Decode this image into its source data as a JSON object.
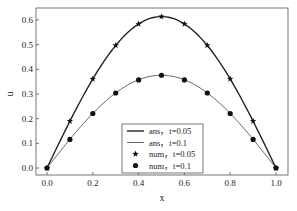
{
  "chart_data": {
    "type": "line",
    "title": "",
    "xlabel": "x",
    "ylabel": "u",
    "xlim": [
      -0.05,
      1.05
    ],
    "ylim": [
      -0.03,
      0.64
    ],
    "grid": false,
    "legend_position": "lower center",
    "x_ticks": [
      "0.0",
      "0.2",
      "0.4",
      "0.6",
      "0.8",
      "1.0"
    ],
    "y_ticks": [
      "0.0",
      "0.1",
      "0.2",
      "0.3",
      "0.4",
      "0.5",
      "0.6"
    ],
    "x": [
      0.0,
      0.1,
      0.2,
      0.3,
      0.4,
      0.5,
      0.6,
      0.7,
      0.8,
      0.9,
      1.0
    ],
    "series": [
      {
        "name": "ans，t=0.05",
        "style": "line",
        "color": "#222222",
        "width": 1.4,
        "values": [
          0.0,
          0.19,
          0.361,
          0.497,
          0.584,
          0.614,
          0.584,
          0.497,
          0.361,
          0.19,
          0.0
        ]
      },
      {
        "name": "ans，t=0.1",
        "style": "line",
        "color": "#555555",
        "width": 0.9,
        "values": [
          0.0,
          0.116,
          0.221,
          0.304,
          0.357,
          0.376,
          0.357,
          0.304,
          0.221,
          0.116,
          0.0
        ]
      },
      {
        "name": "num，t=0.05",
        "style": "marker",
        "marker": "star",
        "color": "#111111",
        "values": [
          0.0,
          0.19,
          0.361,
          0.497,
          0.584,
          0.614,
          0.584,
          0.497,
          0.361,
          0.19,
          0.0
        ]
      },
      {
        "name": "num，t=0.1",
        "style": "marker",
        "marker": "circle",
        "color": "#111111",
        "values": [
          0.0,
          0.116,
          0.221,
          0.304,
          0.357,
          0.376,
          0.357,
          0.304,
          0.221,
          0.116,
          0.0
        ]
      }
    ]
  }
}
